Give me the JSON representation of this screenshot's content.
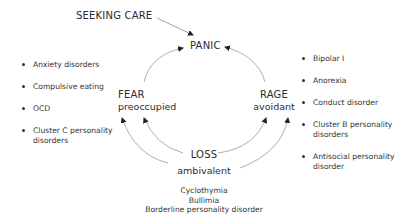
{
  "diagram": {
    "seeking_care": "SEEKING CARE",
    "panic": "PANIC",
    "fear": {
      "title": "FEAR",
      "subtitle": "preoccupied"
    },
    "rage": {
      "title": "RAGE",
      "subtitle": "avoidant"
    },
    "loss": {
      "title": "LOSS",
      "subtitle": "ambivalent"
    },
    "fear_conditions": [
      "Anxiety disorders",
      "Compulsive eating",
      "OCD",
      "Cluster C personality",
      "disorders"
    ],
    "rage_conditions": [
      "Bipolar I",
      "Anorexia",
      "Conduct disorder",
      "Cluster B personality",
      "disorders",
      "Antisocial personality",
      "disorder"
    ],
    "loss_conditions": [
      "Cyclothymia",
      "Bullimia",
      "Borderline personality disorder"
    ],
    "colors": {
      "text": "#2b2b2b",
      "arrow": "#9a9a9a",
      "arrowhead": "#222222",
      "background": "#ffffff"
    }
  }
}
